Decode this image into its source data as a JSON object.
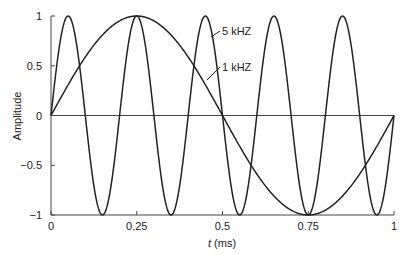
{
  "chart_data": {
    "type": "line",
    "title": "",
    "xlabel_italic": "t",
    "xlabel_unit": " (ms)",
    "xlabel": "t (ms)",
    "ylabel": "Amplitude",
    "xlim": [
      0,
      1
    ],
    "ylim": [
      -1,
      1
    ],
    "grid": false,
    "x_ticks": [
      0,
      0.25,
      0.5,
      0.75,
      1
    ],
    "x_tick_labels": [
      "0",
      "0.25",
      "0.5",
      "0.75",
      "1"
    ],
    "y_ticks": [
      1,
      0.5,
      0,
      -0.5,
      -1
    ],
    "y_tick_labels": [
      "1",
      "0.5",
      "0",
      "−0.5",
      "−1"
    ],
    "series": [
      {
        "name": "5 kHZ",
        "frequency_khz": 5,
        "function": "sin(2*pi*5*t)",
        "color": "#222222",
        "x": [
          0,
          0.05,
          0.1,
          0.15,
          0.2,
          0.25,
          0.3,
          0.35,
          0.4,
          0.45,
          0.5,
          0.55,
          0.6,
          0.65,
          0.7,
          0.75,
          0.8,
          0.85,
          0.9,
          0.95,
          1.0
        ],
        "values": [
          0,
          1,
          0,
          -1,
          0,
          1,
          0,
          -1,
          0,
          1,
          0,
          -1,
          0,
          1,
          0,
          -1,
          0,
          1,
          0,
          -1,
          0
        ]
      },
      {
        "name": "1 kHZ",
        "frequency_khz": 1,
        "function": "sin(2*pi*1*t)",
        "color": "#222222",
        "x": [
          0,
          0.125,
          0.25,
          0.375,
          0.5,
          0.625,
          0.75,
          0.875,
          1.0
        ],
        "values": [
          0,
          0.707,
          1,
          0.707,
          0,
          -0.707,
          -1,
          -0.707,
          0
        ]
      }
    ],
    "annotations": [
      {
        "text": "5 kHZ",
        "points_to_series": "5 kHZ"
      },
      {
        "text": "1 kHZ",
        "points_to_series": "1 kHZ"
      }
    ],
    "legend": "none (inline annotations with leader lines)"
  }
}
